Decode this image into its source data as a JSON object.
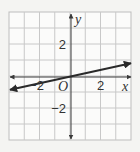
{
  "chart_data": {
    "type": "line",
    "title": "",
    "xlabel": "x",
    "ylabel": "y",
    "origin_label": "O",
    "xlim": [
      -4,
      4
    ],
    "ylim": [
      -4,
      4
    ],
    "grid": true,
    "grid_step": 1,
    "x_tick_labels": [
      {
        "value": -2,
        "label": "−2"
      },
      {
        "value": 2,
        "label": "2"
      }
    ],
    "y_tick_labels": [
      {
        "value": 2,
        "label": "2"
      },
      {
        "value": -2,
        "label": "−2"
      }
    ],
    "series": [
      {
        "name": "line",
        "equation": "y = 0.2x",
        "slope": 0.2,
        "intercept": 0,
        "x": [
          -4,
          4
        ],
        "y": [
          -0.8,
          0.8
        ],
        "arrows_both_ends": true
      }
    ],
    "colors": {
      "line": "#2a2a2a",
      "axis": "#3a3a3a",
      "grid": "#c8c8c8"
    }
  }
}
